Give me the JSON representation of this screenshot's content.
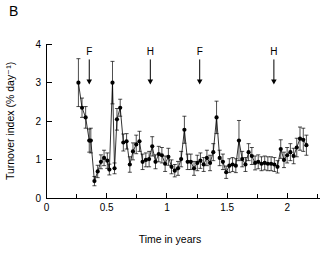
{
  "panel": {
    "label": "B"
  },
  "chart_data": {
    "type": "scatter",
    "title": "",
    "xlabel": "Time in years",
    "ylabel": "Turnover index (% day⁻¹)",
    "xlim": [
      0,
      2.3
    ],
    "ylim": [
      0,
      4
    ],
    "xticks": [
      0,
      0.5,
      1,
      1.5,
      2
    ],
    "xticklabels": [
      "0",
      "0.5",
      "1",
      "1.5",
      "2"
    ],
    "xminorticks": [
      0.25,
      0.75,
      1.25,
      1.75,
      2.25
    ],
    "yticks": [
      0,
      1,
      2,
      3,
      4
    ],
    "yticklabels": [
      "0",
      "1",
      "2",
      "3",
      "4"
    ],
    "grid": false,
    "legend": "none",
    "marker": "filled-circle",
    "errorbars": "symmetric-vertical",
    "series": [
      {
        "name": "Turnover index",
        "x": [
          0.265,
          0.295,
          0.325,
          0.355,
          0.368,
          0.398,
          0.425,
          0.452,
          0.478,
          0.505,
          0.522,
          0.548,
          0.565,
          0.585,
          0.612,
          0.638,
          0.665,
          0.692,
          0.718,
          0.745,
          0.772,
          0.798,
          0.825,
          0.852,
          0.878,
          0.905,
          0.932,
          0.958,
          0.985,
          1.012,
          1.038,
          1.065,
          1.092,
          1.118,
          1.145,
          1.172,
          1.198,
          1.225,
          1.252,
          1.278,
          1.305,
          1.332,
          1.358,
          1.385,
          1.412,
          1.438,
          1.465,
          1.492,
          1.518,
          1.545,
          1.572,
          1.598,
          1.625,
          1.652,
          1.678,
          1.705,
          1.732,
          1.758,
          1.785,
          1.812,
          1.838,
          1.865,
          1.892,
          1.918,
          1.945,
          1.972,
          1.998,
          2.025,
          2.052,
          2.078,
          2.105,
          2.132,
          2.158
        ],
        "y": [
          3.0,
          2.35,
          2.1,
          1.5,
          1.5,
          0.45,
          0.7,
          0.95,
          1.05,
          0.98,
          0.75,
          3.0,
          0.78,
          2.05,
          2.35,
          1.45,
          1.48,
          0.88,
          1.22,
          1.4,
          1.48,
          0.95,
          1.0,
          1.02,
          1.35,
          0.95,
          1.15,
          1.12,
          0.9,
          1.08,
          0.82,
          0.72,
          0.78,
          1.02,
          1.78,
          0.95,
          0.95,
          0.78,
          0.92,
          0.98,
          0.88,
          1.05,
          0.92,
          1.2,
          2.1,
          1.05,
          0.95,
          0.68,
          0.85,
          0.88,
          0.85,
          1.5,
          1.02,
          0.88,
          1.2,
          1.1,
          0.92,
          0.95,
          0.9,
          0.92,
          0.9,
          0.9,
          0.88,
          0.82,
          1.28,
          1.0,
          1.12,
          1.2,
          1.1,
          1.32,
          1.55,
          1.52,
          1.38
        ],
        "yerr": [
          0.62,
          0.25,
          0.28,
          0.3,
          0.32,
          0.12,
          0.16,
          0.18,
          0.2,
          0.2,
          0.14,
          0.55,
          0.14,
          0.28,
          0.22,
          0.22,
          0.2,
          0.2,
          0.22,
          0.24,
          0.26,
          0.2,
          0.18,
          0.2,
          0.25,
          0.18,
          0.2,
          0.2,
          0.2,
          0.22,
          0.18,
          0.16,
          0.18,
          0.2,
          0.35,
          0.2,
          0.2,
          0.18,
          0.2,
          0.2,
          0.18,
          0.2,
          0.2,
          0.22,
          0.42,
          0.2,
          0.2,
          0.16,
          0.18,
          0.18,
          0.18,
          0.52,
          0.2,
          0.18,
          0.22,
          0.22,
          0.18,
          0.18,
          0.18,
          0.18,
          0.18,
          0.18,
          0.18,
          0.16,
          0.24,
          0.2,
          0.2,
          0.22,
          0.2,
          0.24,
          0.3,
          0.3,
          0.26
        ]
      }
    ],
    "annotations": [
      {
        "label": "F",
        "x": 0.355,
        "y_top": 3.6,
        "y_tip": 2.95
      },
      {
        "label": "H",
        "x": 0.862,
        "y_top": 3.6,
        "y_tip": 2.95
      },
      {
        "label": "F",
        "x": 1.272,
        "y_top": 3.6,
        "y_tip": 2.95
      },
      {
        "label": "H",
        "x": 1.888,
        "y_top": 3.6,
        "y_tip": 2.95
      }
    ]
  },
  "colors": {
    "axis": "#000000",
    "marker": "#000000",
    "background": "#ffffff"
  }
}
